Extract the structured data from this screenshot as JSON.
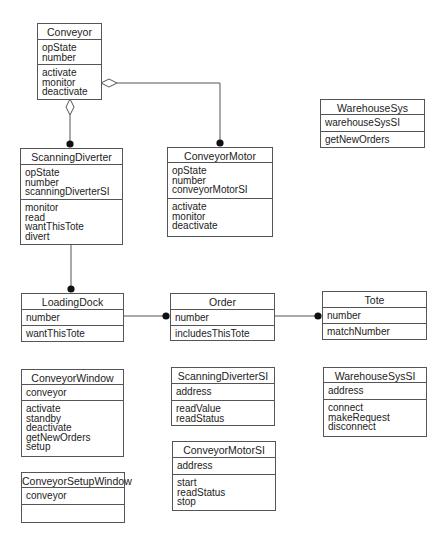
{
  "diagram": {
    "type": "UML class diagram",
    "classes": {
      "conveyor": {
        "name": "Conveyor",
        "attributes": [
          "opState",
          "number"
        ],
        "operations": [
          "activate",
          "monitor",
          "deactivate"
        ]
      },
      "scanningDiverter": {
        "name": "ScanningDiverter",
        "attributes": [
          "opState",
          "number",
          "scanningDiverterSI"
        ],
        "operations": [
          "monitor",
          "read",
          "wantThisTote",
          "divert"
        ]
      },
      "conveyorMotor": {
        "name": "ConveyorMotor",
        "attributes": [
          "opState",
          "number",
          "conveyorMotorSI"
        ],
        "operations": [
          "activate",
          "monitor",
          "deactivate"
        ]
      },
      "warehouseSys": {
        "name": "WarehouseSys",
        "attributes": [
          "warehouseSysSI"
        ],
        "operations": [
          "getNewOrders"
        ]
      },
      "loadingDock": {
        "name": "LoadingDock",
        "attributes": [
          "number"
        ],
        "operations": [
          "wantThisTote"
        ]
      },
      "order": {
        "name": "Order",
        "attributes": [
          "number"
        ],
        "operations": [
          "includesThisTote"
        ]
      },
      "tote": {
        "name": "Tote",
        "attributes": [
          "number"
        ],
        "operations": [
          "matchNumber"
        ]
      },
      "conveyorWindow": {
        "name": "ConveyorWindow",
        "attributes": [
          "conveyor"
        ],
        "operations": [
          "activate",
          "standby",
          "deactivate",
          "getNewOrders",
          "setup"
        ]
      },
      "conveyorSetupWindow": {
        "name": "ConveyorSetupWindow",
        "attributes": [
          "conveyor"
        ],
        "operations": []
      },
      "scanningDiverterSI": {
        "name": "ScanningDiverterSI",
        "attributes": [
          "address"
        ],
        "operations": [
          "readValue",
          "readStatus"
        ]
      },
      "conveyorMotorSI": {
        "name": "ConveyorMotorSI",
        "attributes": [
          "address"
        ],
        "operations": [
          "start",
          "readStatus",
          "stop"
        ]
      },
      "warehouseSysSI": {
        "name": "WarehouseSysSI",
        "attributes": [
          "address"
        ],
        "operations": [
          "connect",
          "makeRequest",
          "disconnect"
        ]
      }
    },
    "relationships": [
      {
        "from": "Conveyor",
        "to": "ScanningDiverter",
        "kind": "aggregation",
        "source_end": "hollow-diamond",
        "target_end": "filled-dot"
      },
      {
        "from": "Conveyor",
        "to": "ConveyorMotor",
        "kind": "aggregation",
        "source_end": "hollow-diamond",
        "target_end": "filled-dot"
      },
      {
        "from": "ScanningDiverter",
        "to": "LoadingDock",
        "kind": "association",
        "target_end": "filled-dot"
      },
      {
        "from": "LoadingDock",
        "to": "Order",
        "kind": "association",
        "target_end": "filled-dot"
      },
      {
        "from": "Order",
        "to": "Tote",
        "kind": "association",
        "target_end": "filled-dot"
      }
    ],
    "colors": {
      "line": "#555555",
      "background": "#ffffff",
      "text": "#222222"
    }
  }
}
